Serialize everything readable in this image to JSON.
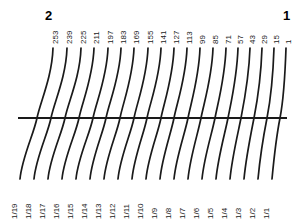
{
  "figure": {
    "kind": "nomogram",
    "background_color": "#ffffff",
    "line_color": "#1a1a1a",
    "corner_labels": {
      "top_left": "2",
      "top_right": "1"
    }
  },
  "chart_data": {
    "type": "line",
    "title": "",
    "xlabel": "",
    "ylabel": "",
    "grid": false,
    "legend": "none",
    "axis_line": {
      "orientation": "horizontal",
      "x_start": 18,
      "x_end": 287,
      "y": 118
    },
    "scale_top_label": "2",
    "scale_bottom_label": "1",
    "curve_count": 19,
    "top_tick_labels": [
      "253",
      "239",
      "225",
      "211",
      "197",
      "183",
      "169",
      "155",
      "141",
      "127",
      "113",
      "99",
      "85",
      "71",
      "57",
      "43",
      "29",
      "15",
      "1"
    ],
    "bottom_tick_labels": [
      "1/19",
      "1/18",
      "1/17",
      "1/16",
      "1/15",
      "1/14",
      "1/13",
      "1/12",
      "1/11",
      "1/10",
      "1/9",
      "1/8",
      "1/7",
      "1/6",
      "1/5",
      "1/4",
      "1/3",
      "1/2",
      "1/1"
    ],
    "curves": [
      {
        "top_label": "253",
        "bottom_label": "1/19",
        "x_top": 53,
        "x_mid": 37,
        "x_bottom": 20
      },
      {
        "top_label": "239",
        "bottom_label": "1/18",
        "x_top": 67,
        "x_mid": 51,
        "x_bottom": 34
      },
      {
        "top_label": "225",
        "bottom_label": "1/17",
        "x_top": 81,
        "x_mid": 65,
        "x_bottom": 48
      },
      {
        "top_label": "211",
        "bottom_label": "1/16",
        "x_top": 94,
        "x_mid": 79,
        "x_bottom": 62
      },
      {
        "top_label": "197",
        "bottom_label": "1/15",
        "x_top": 108,
        "x_mid": 93,
        "x_bottom": 76
      },
      {
        "top_label": "183",
        "bottom_label": "1/14",
        "x_top": 121,
        "x_mid": 106,
        "x_bottom": 90
      },
      {
        "top_label": "169",
        "bottom_label": "1/13",
        "x_top": 134,
        "x_mid": 120,
        "x_bottom": 104
      },
      {
        "top_label": "155",
        "bottom_label": "1/12",
        "x_top": 148,
        "x_mid": 134,
        "x_bottom": 118
      },
      {
        "top_label": "141",
        "bottom_label": "1/11",
        "x_top": 161,
        "x_mid": 147,
        "x_bottom": 132
      },
      {
        "top_label": "127",
        "bottom_label": "1/10",
        "x_top": 174,
        "x_mid": 161,
        "x_bottom": 146
      },
      {
        "top_label": "113",
        "bottom_label": "1/9",
        "x_top": 187,
        "x_mid": 174,
        "x_bottom": 160
      },
      {
        "top_label": "99",
        "bottom_label": "1/8",
        "x_top": 200,
        "x_mid": 188,
        "x_bottom": 174
      },
      {
        "top_label": "85",
        "bottom_label": "1/7",
        "x_top": 213,
        "x_mid": 201,
        "x_bottom": 188
      },
      {
        "top_label": "71",
        "bottom_label": "1/6",
        "x_top": 226,
        "x_mid": 215,
        "x_bottom": 202
      },
      {
        "top_label": "57",
        "bottom_label": "1/5",
        "x_top": 238,
        "x_mid": 228,
        "x_bottom": 216
      },
      {
        "top_label": "43",
        "bottom_label": "1/4",
        "x_top": 250,
        "x_mid": 241,
        "x_bottom": 230
      },
      {
        "top_label": "29",
        "bottom_label": "1/3",
        "x_top": 262,
        "x_mid": 254,
        "x_bottom": 244
      },
      {
        "top_label": "15",
        "bottom_label": "1/2",
        "x_top": 274,
        "x_mid": 267,
        "x_bottom": 258
      },
      {
        "top_label": "1",
        "bottom_label": "1/1",
        "x_top": 286,
        "x_mid": 280,
        "x_bottom": 272
      }
    ],
    "curve_geometry": {
      "y_top": 48,
      "y_bottom": 179,
      "y_axis": 118
    }
  }
}
